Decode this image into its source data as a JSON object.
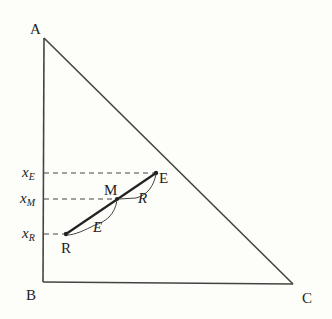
{
  "diagram": {
    "type": "ternary-triangle-mixing-diagram",
    "colors": {
      "background": "#fdfdf9",
      "line": "#444444",
      "text": "#222222"
    },
    "vertices": {
      "A": {
        "label": "A",
        "x": 44,
        "y": 38
      },
      "B": {
        "label": "B",
        "x": 43,
        "y": 282
      },
      "C": {
        "label": "C",
        "x": 293,
        "y": 284
      }
    },
    "points": {
      "E": {
        "label": "E",
        "x": 156,
        "y": 173
      },
      "M": {
        "label": "M",
        "x": 117,
        "y": 199
      },
      "R": {
        "label": "R",
        "x": 66,
        "y": 234
      }
    },
    "axis_labels": {
      "xE": {
        "base": "x",
        "sub": "E"
      },
      "xM": {
        "base": "x",
        "sub": "M"
      },
      "xR": {
        "base": "x",
        "sub": "R"
      }
    },
    "segment_labels": {
      "upper": "R",
      "lower": "E"
    }
  }
}
